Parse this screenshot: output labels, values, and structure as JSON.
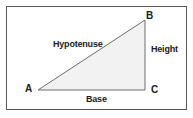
{
  "diagram": {
    "type": "right-triangle-geometry",
    "frame": {
      "border_color": "#5a5a5a",
      "background_color": "#ffffff",
      "x": 6,
      "y": 6,
      "width": 181,
      "height": 104
    },
    "triangle": {
      "fill_color": "#f2f2f2",
      "stroke_color": "#6e6e6e",
      "stroke_width": 1,
      "vertices": [
        {
          "name": "A",
          "x": 38,
          "y": 90,
          "angle_type": "acute"
        },
        {
          "name": "B",
          "x": 145,
          "y": 20,
          "angle_type": "acute"
        },
        {
          "name": "C",
          "x": 145,
          "y": 90,
          "angle_type": "right"
        }
      ]
    },
    "vertex_labels": {
      "a": "A",
      "b": "B",
      "c": "C"
    },
    "side_labels": {
      "hypotenuse": "Hypotenuse",
      "height": "Height",
      "base": "Base"
    }
  }
}
